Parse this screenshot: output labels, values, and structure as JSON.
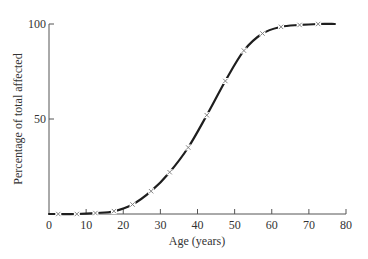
{
  "chart_data": {
    "type": "line",
    "title": "",
    "xlabel": "Age (years)",
    "ylabel": "Percentage of total affected",
    "xlim": [
      0,
      80
    ],
    "ylim": [
      0,
      100
    ],
    "x_ticks": [
      0,
      10,
      20,
      30,
      40,
      50,
      60,
      70,
      80
    ],
    "y_ticks": [
      50,
      100
    ],
    "grid": false,
    "legend": null,
    "series": [
      {
        "name": "Cumulative percentage affected",
        "marker": "x",
        "x": [
          2.5,
          7.5,
          12.5,
          17.5,
          22.5,
          27.5,
          32.5,
          37.5,
          42.5,
          47.5,
          52.5,
          57.5,
          62.5,
          67.5,
          72.5
        ],
        "values": [
          0,
          0,
          0.5,
          1.5,
          5,
          12,
          22,
          35,
          52,
          70,
          86,
          95,
          98.5,
          99.5,
          100
        ]
      }
    ],
    "curve_extent": [
      0,
      77
    ]
  },
  "colors": {
    "axis": "#555555",
    "curve": "#1e1e1e",
    "marker": "#777777",
    "text": "#333333"
  },
  "layout": {
    "plot_left": 49,
    "plot_right": 346,
    "plot_top": 24,
    "plot_bottom": 214
  }
}
